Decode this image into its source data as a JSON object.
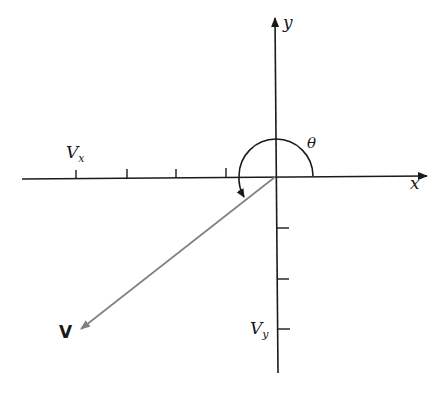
{
  "diagram": {
    "title": "",
    "axes": {
      "x_label": "x",
      "y_label": "y"
    },
    "angle_label": "θ",
    "vector_label": "V",
    "component_labels": {
      "vx_main": "V",
      "vx_sub": "x",
      "vy_main": "V",
      "vy_sub": "y"
    },
    "colors": {
      "axes": "#1a1a1a",
      "vector": "#808080",
      "background": "#ffffff"
    }
  }
}
